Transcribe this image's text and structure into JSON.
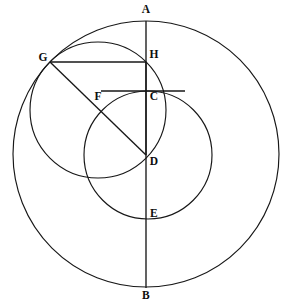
{
  "figure": {
    "width": 285,
    "height": 306,
    "background_color": "#ffffff",
    "stroke_color": "#171717",
    "label_color": "#0d0d0d"
  },
  "circles": [
    {
      "name": "large-circle",
      "cx": 146,
      "cy": 154,
      "r": 133,
      "description": "Outer circle through A at top and B at bottom"
    },
    {
      "name": "medium-circle",
      "cx": 148,
      "cy": 155,
      "r": 64,
      "description": "Circle centred at D passing through C and E"
    },
    {
      "name": "small-circle",
      "cx": 98,
      "cy": 110,
      "r": 68,
      "description": "Circle through G, H and D"
    }
  ],
  "lines": [
    {
      "name": "segment-AB",
      "x1": 146,
      "y1": 21,
      "x2": 146,
      "y2": 288,
      "description": "Vertical diameter from A to B through H, C, D, E"
    },
    {
      "name": "segment-GH",
      "x1": 50,
      "y1": 62,
      "x2": 146,
      "y2": 62,
      "description": "Horizontal chord from G to H"
    },
    {
      "name": "segment-GD",
      "x1": 50,
      "y1": 62,
      "x2": 146,
      "y2": 155,
      "description": "Diagonal from G through F to D"
    },
    {
      "name": "segment-HD",
      "x1": 146,
      "y1": 62,
      "x2": 146,
      "y2": 155,
      "description": "Vertical segment from H to D"
    },
    {
      "name": "segment-FC",
      "x1": 101,
      "y1": 91,
      "x2": 185,
      "y2": 91,
      "description": "Horizontal chord through F and C at the top of the medium circle"
    }
  ],
  "points": [
    {
      "name": "point-A",
      "label": "A",
      "x": 146,
      "y": 21,
      "label_x": 146,
      "label_y": 10
    },
    {
      "name": "point-H",
      "label": "H",
      "x": 146,
      "y": 62,
      "label_x": 154,
      "label_y": 55
    },
    {
      "name": "point-G",
      "label": "G",
      "x": 50,
      "y": 62,
      "label_x": 43,
      "label_y": 58
    },
    {
      "name": "point-F",
      "label": "F",
      "x": 101,
      "y": 105,
      "label_x": 98,
      "label_y": 97
    },
    {
      "name": "point-C",
      "label": "C",
      "x": 146,
      "y": 91,
      "label_x": 154,
      "label_y": 97
    },
    {
      "name": "point-D",
      "label": "D",
      "x": 146,
      "y": 155,
      "label_x": 154,
      "label_y": 162
    },
    {
      "name": "point-E",
      "label": "E",
      "x": 146,
      "y": 219,
      "label_x": 154,
      "label_y": 214
    },
    {
      "name": "point-B",
      "label": "B",
      "x": 146,
      "y": 288,
      "label_x": 146,
      "label_y": 296
    }
  ]
}
